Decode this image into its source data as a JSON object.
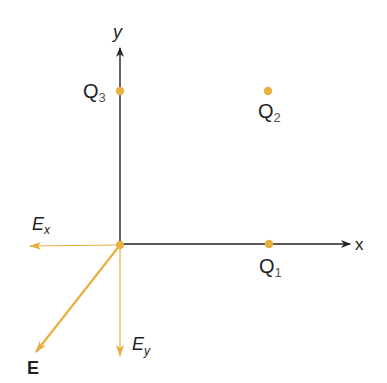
{
  "colors": {
    "axis": "#222222",
    "charge": "#e8b040",
    "vector": "#e8b040"
  },
  "axes": {
    "x_label": "x",
    "y_label": "y"
  },
  "charges": [
    {
      "name": "Q",
      "sub": "1"
    },
    {
      "name": "Q",
      "sub": "2"
    },
    {
      "name": "Q",
      "sub": "3"
    }
  ],
  "vectors": {
    "ex": {
      "name": "E",
      "sub": "x"
    },
    "ey": {
      "name": "E",
      "sub": "y"
    },
    "e": {
      "name": "E"
    }
  }
}
